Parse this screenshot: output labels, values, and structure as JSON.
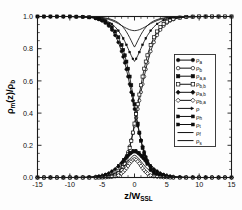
{
  "chart_data": {
    "type": "line",
    "title": "",
    "xlabel": "z/W_SSL",
    "xlabel_main": "z/W",
    "xlabel_sub": "SSL",
    "ylabel": "ρ_m(z)/ρ_b",
    "ylabel_parts": {
      "rho": "ρ",
      "sub_m": "m",
      "mid": "(z)/",
      "rho2": "ρ",
      "sub_b": "b"
    },
    "xlim": [
      -15,
      15
    ],
    "ylim": [
      0.0,
      1.0
    ],
    "xticks": [
      -15,
      -10,
      -5,
      0,
      5,
      10,
      15
    ],
    "xticklabels": [
      "-15",
      "-10",
      "-5",
      "0",
      "5",
      "10",
      "15"
    ],
    "yticks": [
      0.0,
      0.2,
      0.4,
      0.6,
      0.8,
      1.0
    ],
    "yticklabels": [
      "0.0",
      "0.2",
      "0.4",
      "0.6",
      "0.8",
      "1.0"
    ],
    "x_minor_per_interval": 5,
    "y_minor_per_interval": 4,
    "grid": false,
    "legend_position": "right-center",
    "axis_color": "#1a1a1a",
    "curve_color": "#0d0d0d",
    "x": [
      -15,
      -14,
      -13,
      -12,
      -11,
      -10,
      -9,
      -8,
      -7,
      -6,
      -5.5,
      -5,
      -4.5,
      -4,
      -3.5,
      -3,
      -2.5,
      -2,
      -1.75,
      -1.5,
      -1.25,
      -1,
      -0.75,
      -0.5,
      -0.25,
      0,
      0.25,
      0.5,
      0.75,
      1,
      1.25,
      1.5,
      1.75,
      2,
      2.5,
      3,
      3.5,
      4,
      4.5,
      5,
      5.5,
      6,
      7,
      8,
      9,
      10,
      11,
      12,
      13,
      14,
      15
    ],
    "series": [
      {
        "name": "rho_a",
        "label_main": "ρ",
        "label_sub": "a",
        "marker": "circle-filled",
        "line": true,
        "values": [
          1.0,
          1.0,
          1.0,
          1.0,
          1.0,
          1.0,
          0.999,
          0.998,
          0.995,
          0.988,
          0.982,
          0.973,
          0.96,
          0.942,
          0.917,
          0.884,
          0.84,
          0.784,
          0.75,
          0.713,
          0.672,
          0.627,
          0.58,
          0.53,
          0.478,
          0.425,
          0.372,
          0.322,
          0.275,
          0.232,
          0.193,
          0.159,
          0.129,
          0.104,
          0.066,
          0.041,
          0.025,
          0.015,
          0.009,
          0.005,
          0.003,
          0.002,
          0.001,
          0.0,
          0.0,
          0.0,
          0.0,
          0.0,
          0.0,
          0.0,
          0.0
        ]
      },
      {
        "name": "rho_b",
        "label_main": "ρ",
        "label_sub": "b",
        "marker": "circle-open",
        "line": true,
        "values": [
          0.0,
          0.0,
          0.0,
          0.0,
          0.0,
          0.0,
          0.0,
          0.0,
          0.0,
          0.001,
          0.002,
          0.003,
          0.005,
          0.009,
          0.015,
          0.025,
          0.041,
          0.066,
          0.084,
          0.104,
          0.129,
          0.159,
          0.193,
          0.232,
          0.275,
          0.322,
          0.372,
          0.425,
          0.478,
          0.53,
          0.58,
          0.627,
          0.672,
          0.713,
          0.784,
          0.84,
          0.884,
          0.917,
          0.942,
          0.96,
          0.973,
          0.982,
          0.993,
          0.997,
          0.999,
          1.0,
          1.0,
          1.0,
          1.0,
          1.0,
          1.0
        ]
      },
      {
        "name": "rho_aa",
        "label_main": "ρ",
        "label_sub": "a,a",
        "marker": "square-filled",
        "line": true,
        "values": [
          1.0,
          1.0,
          1.0,
          1.0,
          1.0,
          1.0,
          0.999,
          0.998,
          0.995,
          0.99,
          0.985,
          0.978,
          0.968,
          0.954,
          0.934,
          0.907,
          0.871,
          0.823,
          0.793,
          0.759,
          0.72,
          0.676,
          0.627,
          0.573,
          0.515,
          0.455,
          0.394,
          0.335,
          0.279,
          0.228,
          0.183,
          0.144,
          0.112,
          0.085,
          0.048,
          0.026,
          0.013,
          0.007,
          0.003,
          0.002,
          0.001,
          0.0,
          0.0,
          0.0,
          0.0,
          0.0,
          0.0,
          0.0,
          0.0,
          0.0,
          0.0
        ]
      },
      {
        "name": "rho_bb",
        "label_main": "ρ",
        "label_sub": "b,b",
        "marker": "square-open",
        "line": true,
        "values": [
          0.0,
          0.0,
          0.0,
          0.0,
          0.0,
          0.0,
          0.0,
          0.0,
          0.0,
          0.0,
          0.001,
          0.001,
          0.002,
          0.003,
          0.007,
          0.013,
          0.026,
          0.048,
          0.065,
          0.085,
          0.112,
          0.144,
          0.183,
          0.228,
          0.279,
          0.335,
          0.394,
          0.455,
          0.515,
          0.573,
          0.627,
          0.676,
          0.72,
          0.759,
          0.823,
          0.871,
          0.907,
          0.934,
          0.954,
          0.968,
          0.978,
          0.985,
          0.993,
          0.997,
          0.999,
          1.0,
          1.0,
          1.0,
          1.0,
          1.0,
          1.0
        ]
      },
      {
        "name": "rho_ab",
        "label_main": "ρ",
        "label_sub": "a,b",
        "marker": "diamond-filled",
        "line": true,
        "values": [
          0.0,
          0.0,
          0.0,
          0.0,
          0.0,
          0.0,
          0.0,
          0.001,
          0.002,
          0.005,
          0.008,
          0.012,
          0.018,
          0.026,
          0.037,
          0.051,
          0.068,
          0.09,
          0.101,
          0.113,
          0.124,
          0.135,
          0.145,
          0.153,
          0.159,
          0.162,
          0.159,
          0.153,
          0.145,
          0.135,
          0.124,
          0.113,
          0.101,
          0.09,
          0.068,
          0.051,
          0.037,
          0.026,
          0.018,
          0.012,
          0.008,
          0.005,
          0.002,
          0.001,
          0.0,
          0.0,
          0.0,
          0.0,
          0.0,
          0.0,
          0.0
        ]
      },
      {
        "name": "rho_ba",
        "label_main": "ρ",
        "label_sub": "b,a",
        "marker": "diamond-open",
        "line": true,
        "values": [
          0.0,
          0.0,
          0.0,
          0.0,
          0.0,
          0.0,
          0.0,
          0.0,
          0.0,
          0.0,
          0.0,
          0.001,
          0.001,
          0.002,
          0.004,
          0.007,
          0.013,
          0.025,
          0.034,
          0.045,
          0.058,
          0.072,
          0.087,
          0.1,
          0.11,
          0.115,
          0.11,
          0.1,
          0.087,
          0.072,
          0.058,
          0.045,
          0.034,
          0.025,
          0.013,
          0.007,
          0.004,
          0.002,
          0.001,
          0.001,
          0.0,
          0.0,
          0.0,
          0.0,
          0.0,
          0.0,
          0.0,
          0.0,
          0.0,
          0.0,
          0.0
        ]
      },
      {
        "name": "rho_total",
        "label_main": "ρ",
        "label_sub": "",
        "marker": "arrow",
        "line": true,
        "values": [
          1.0,
          1.0,
          1.0,
          1.0,
          1.0,
          1.0,
          0.999,
          0.999,
          0.998,
          0.996,
          0.994,
          0.991,
          0.987,
          0.982,
          0.975,
          0.966,
          0.956,
          0.944,
          0.938,
          0.932,
          0.927,
          0.922,
          0.918,
          0.915,
          0.913,
          0.912,
          0.913,
          0.915,
          0.918,
          0.922,
          0.927,
          0.932,
          0.938,
          0.944,
          0.956,
          0.966,
          0.975,
          0.982,
          0.987,
          0.991,
          0.994,
          0.996,
          0.998,
          0.999,
          1.0,
          1.0,
          1.0,
          1.0,
          1.0,
          1.0,
          1.0
        ]
      },
      {
        "name": "rho_h",
        "label_main": "ρ",
        "label_sub": "h",
        "marker": "arrow-filled",
        "line": true,
        "values": [
          1.0,
          1.0,
          1.0,
          1.0,
          1.0,
          1.0,
          0.999,
          0.998,
          0.996,
          0.992,
          0.989,
          0.984,
          0.977,
          0.967,
          0.954,
          0.936,
          0.912,
          0.882,
          0.864,
          0.845,
          0.824,
          0.802,
          0.779,
          0.757,
          0.737,
          0.721,
          0.737,
          0.757,
          0.779,
          0.802,
          0.824,
          0.845,
          0.864,
          0.882,
          0.912,
          0.936,
          0.954,
          0.967,
          0.977,
          0.984,
          0.989,
          0.992,
          0.996,
          0.998,
          0.999,
          1.0,
          1.0,
          1.0,
          1.0,
          1.0,
          1.0
        ]
      },
      {
        "name": "rho_t",
        "label_main": "ρ",
        "label_sub": "t",
        "marker": "arrow-filled2",
        "line": true,
        "values": [
          0.0,
          0.0,
          0.0,
          0.0,
          0.0,
          0.0,
          0.001,
          0.001,
          0.003,
          0.006,
          0.009,
          0.014,
          0.02,
          0.029,
          0.041,
          0.057,
          0.077,
          0.1,
          0.112,
          0.124,
          0.136,
          0.147,
          0.157,
          0.165,
          0.17,
          0.172,
          0.17,
          0.165,
          0.157,
          0.147,
          0.136,
          0.124,
          0.112,
          0.1,
          0.077,
          0.057,
          0.041,
          0.029,
          0.02,
          0.014,
          0.009,
          0.006,
          0.003,
          0.001,
          0.001,
          0.0,
          0.0,
          0.0,
          0.0,
          0.0,
          0.0
        ]
      },
      {
        "name": "rho_f",
        "label_main": "ρ",
        "label_sub": "f",
        "marker": "line-thick",
        "line": true,
        "values": [
          1.0,
          1.0,
          1.0,
          1.0,
          1.0,
          1.0,
          1.0,
          0.999,
          0.999,
          0.997,
          0.996,
          0.994,
          0.991,
          0.987,
          0.981,
          0.973,
          0.961,
          0.944,
          0.933,
          0.92,
          0.905,
          0.888,
          0.869,
          0.849,
          0.828,
          0.81,
          0.828,
          0.849,
          0.869,
          0.888,
          0.905,
          0.92,
          0.933,
          0.944,
          0.961,
          0.973,
          0.981,
          0.987,
          0.991,
          0.994,
          0.996,
          0.997,
          0.999,
          1.0,
          1.0,
          1.0,
          1.0,
          1.0,
          1.0,
          1.0,
          1.0
        ]
      },
      {
        "name": "rho_s",
        "label_main": "ρ",
        "label_sub": "s",
        "marker": "line-thin",
        "line": true,
        "values": [
          0.0,
          0.0,
          0.0,
          0.0,
          0.0,
          0.0,
          0.0,
          0.0,
          0.001,
          0.002,
          0.003,
          0.005,
          0.008,
          0.012,
          0.018,
          0.026,
          0.038,
          0.054,
          0.064,
          0.076,
          0.088,
          0.101,
          0.114,
          0.125,
          0.134,
          0.138,
          0.134,
          0.125,
          0.114,
          0.101,
          0.088,
          0.076,
          0.064,
          0.054,
          0.038,
          0.026,
          0.018,
          0.012,
          0.008,
          0.005,
          0.003,
          0.002,
          0.001,
          0.0,
          0.0,
          0.0,
          0.0,
          0.0,
          0.0,
          0.0,
          0.0
        ]
      }
    ]
  }
}
